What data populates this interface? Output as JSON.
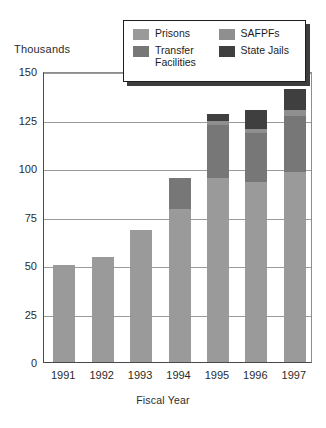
{
  "chart_data": {
    "type": "bar",
    "subtype": "stacked-bar",
    "title": "",
    "subtitle": "",
    "xlabel": "Fiscal Year",
    "ylabel": "Thousands",
    "y_unit_label": "Thousands",
    "categories": [
      "1991",
      "1992",
      "1993",
      "1994",
      "1995",
      "1996",
      "1997"
    ],
    "ylim": [
      0,
      150
    ],
    "yticks": [
      0,
      25,
      50,
      75,
      100,
      125,
      150
    ],
    "ytick_labels": [
      "0",
      "25",
      "50",
      "75",
      "100",
      "125",
      "150"
    ],
    "grid": true,
    "grid_axis": "y",
    "legend_position": "top-right",
    "series": [
      {
        "name": "Prisons",
        "color": "#9a9a9a",
        "values": [
          50,
          54,
          68,
          79,
          95,
          93,
          98
        ]
      },
      {
        "name": "Transfer Facilities",
        "color": "#777777",
        "values": [
          0,
          0,
          0,
          16,
          27,
          25,
          29
        ]
      },
      {
        "name": "SAFPFs",
        "color": "#8f8f8f",
        "values": [
          0,
          0,
          0,
          0,
          2,
          2,
          3
        ]
      },
      {
        "name": "State Jails",
        "color": "#3f3f3f",
        "values": [
          0,
          0,
          0,
          0,
          4,
          10,
          11
        ]
      }
    ],
    "totals": [
      50,
      54,
      68,
      95,
      128,
      130,
      141
    ]
  },
  "legend": {
    "items": [
      {
        "label": "Prisons",
        "color": "#9a9a9a"
      },
      {
        "label": "SAFPFs",
        "color": "#8f8f8f"
      },
      {
        "label": "Transfer\nFacilities",
        "color": "#777777"
      },
      {
        "label": "State Jails",
        "color": "#3f3f3f"
      }
    ]
  },
  "colors": {
    "prisons": "#9a9a9a",
    "transfer_facilities": "#777777",
    "safpfs": "#8f8f8f",
    "state_jails": "#3f3f3f",
    "axis": "#4a4a4a",
    "grid": "#9a9a9a",
    "text": "#2b2b2b",
    "background": "#ffffff"
  }
}
